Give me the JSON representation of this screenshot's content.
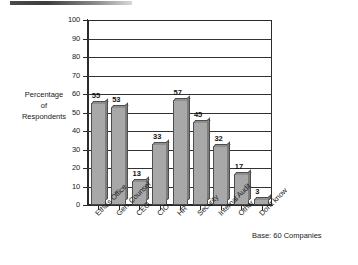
{
  "chart_data": {
    "type": "bar",
    "title": "",
    "xlabel": "",
    "ylabel": "Percentage of Respondents",
    "ylabel_lines": [
      "Percentage",
      "of",
      "Respondents"
    ],
    "ylim": [
      0,
      100
    ],
    "yticks": [
      0,
      10,
      20,
      30,
      40,
      50,
      60,
      70,
      80,
      90,
      100
    ],
    "ytick_labels": [
      "0",
      "10",
      "20",
      "30",
      "40",
      "50",
      "60",
      "70",
      "80",
      "90",
      "100"
    ],
    "grid": true,
    "legend": "none",
    "categories": [
      "Ethics Office",
      "Gen. Counsel",
      "CEO",
      "CIO",
      "HR",
      "Security",
      "Internal Audit",
      "Other",
      "Don't know"
    ],
    "values": [
      55,
      53,
      13,
      33,
      57,
      45,
      32,
      17,
      3
    ],
    "value_labels": [
      "55",
      "53",
      "13",
      "33",
      "57",
      "45",
      "32",
      "17",
      "3"
    ],
    "annotation": "Base: 60 Companies",
    "colors": {
      "bar_face": "#a8a8a8",
      "bar_top": "#8f8f8f",
      "bar_side": "#7d7d7d",
      "bar_edge": "#4d4d4d",
      "axis": "#2b2b2b",
      "grid": "#333333",
      "text": "#1a1a1a",
      "background": "#ffffff"
    }
  }
}
